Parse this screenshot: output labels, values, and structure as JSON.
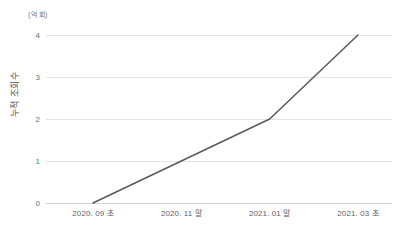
{
  "chart_data": {
    "type": "line",
    "title": "",
    "subtitle": "",
    "xlabel": "",
    "ylabel": "누적 조회수",
    "unit_label": "(억 회)",
    "categories": [
      "2020. 09 초",
      "2020. 11 말",
      "2021. 01 말",
      "2021. 03 초"
    ],
    "values": [
      0,
      1,
      2,
      4
    ],
    "series": [
      {
        "name": "누적 조회수",
        "values": [
          0,
          1,
          2,
          4
        ],
        "color": "#595959"
      }
    ],
    "ylim": [
      0,
      4
    ],
    "yticks": [
      0,
      1,
      2,
      3,
      4
    ],
    "ytick_labels": [
      "0",
      "1",
      "2",
      "3",
      "4"
    ],
    "grid": true,
    "grid_axis": "y",
    "legend": false,
    "legend_position": "none",
    "markers": false,
    "line_width": 1.5
  },
  "colors": {
    "line": "#595959",
    "grid": "#e4e4e4",
    "baseline": "#d0d0d0",
    "tick_text": "#6e6e6e",
    "axis_title": "#555555",
    "unit_text": "#7a7a7a",
    "background": "#ffffff"
  }
}
